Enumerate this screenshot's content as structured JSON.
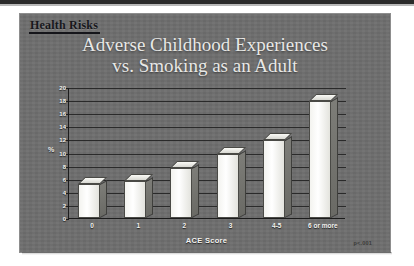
{
  "slide": {
    "header_label": "Health Risks",
    "p_value_note": "p<.001"
  },
  "chart_data": {
    "type": "bar",
    "title": "Adverse Childhood Experiences vs. Smoking as an Adult",
    "title_line1": "Adverse Childhood Experiences",
    "title_line2": "vs. Smoking as an Adult",
    "categories": [
      "0",
      "1",
      "2",
      "3",
      "4-5",
      "6 or more"
    ],
    "values": [
      5.2,
      5.7,
      7.7,
      9.8,
      11.9,
      17.8
    ],
    "series": [
      {
        "name": "Current smoking prevalence",
        "values": [
          5.2,
          5.7,
          7.7,
          9.8,
          11.9,
          17.8
        ]
      }
    ],
    "xlabel": "ACE Score",
    "ylabel": "%",
    "ylim": [
      0,
      20
    ],
    "ytick_step": 2,
    "yticks": [
      "0",
      "2",
      "4",
      "6",
      "8",
      "10",
      "12",
      "14",
      "16",
      "18",
      "20"
    ],
    "grid": true,
    "legend": "none",
    "annotation": "p<.001",
    "style": "3d-column",
    "colors": {
      "slide_background": "#6e6e6e",
      "bar_face": "#f7f7f3",
      "bar_side": "#74746f",
      "axis": "#1c1c1c",
      "title_text": "#e8e8e6",
      "header_text": "#17171c"
    }
  }
}
